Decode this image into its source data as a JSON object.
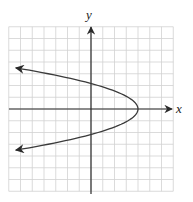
{
  "chart_data": {
    "type": "line",
    "title": "",
    "xlabel": "x",
    "ylabel": "y",
    "grid": true,
    "xlim": [
      -7,
      7
    ],
    "ylim": [
      -7,
      7
    ],
    "tick_labels": [],
    "curve": {
      "description": "Parabola opening to the left with arrows at both ends",
      "equation": "x = 4 - y^2",
      "vertex": [
        4,
        0
      ],
      "intercepts": [
        [
          0,
          2
        ],
        [
          0,
          -2
        ]
      ],
      "sample_points": [
        [
          4,
          0
        ],
        [
          3,
          1
        ],
        [
          3,
          -1
        ],
        [
          0,
          2
        ],
        [
          0,
          -2
        ],
        [
          -4.3,
          3
        ],
        [
          -4.3,
          -3
        ],
        [
          -6.4,
          3.5
        ],
        [
          -6.4,
          -3.5
        ]
      ],
      "arrow_ends": [
        [
          -6.4,
          3.5
        ],
        [
          -6.4,
          -3.5
        ]
      ]
    }
  },
  "labels": {
    "x_axis": "x",
    "y_axis": "y"
  },
  "colors": {
    "grid": "#cfcfcf",
    "axis": "#2a2a2a",
    "curve": "#3a3a3a"
  }
}
